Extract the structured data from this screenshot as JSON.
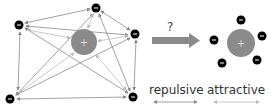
{
  "diagram": {
    "left_cluster": {
      "center_charge": {
        "sign": "+",
        "x": 84,
        "y": 42,
        "r": 13,
        "color": "#8a8a8a"
      },
      "negative_charges": [
        {
          "sign": "-",
          "x": 19,
          "y": 25
        },
        {
          "sign": "-",
          "x": 96,
          "y": 8
        },
        {
          "sign": "-",
          "x": 135,
          "y": 34
        },
        {
          "sign": "-",
          "x": 10,
          "y": 99
        },
        {
          "sign": "-",
          "x": 133,
          "y": 97
        }
      ]
    },
    "transition": {
      "label": "?",
      "arrow_color": "#8a8a8a"
    },
    "right_cluster": {
      "center_charge": {
        "sign": "+",
        "x": 241,
        "y": 43,
        "r": 14,
        "color": "#8a8a8a"
      },
      "negative_charges": [
        {
          "sign": "-",
          "x": 214,
          "y": 40
        },
        {
          "sign": "-",
          "x": 241,
          "y": 20
        },
        {
          "sign": "-",
          "x": 262,
          "y": 36
        },
        {
          "sign": "-",
          "x": 222,
          "y": 63
        },
        {
          "sign": "-",
          "x": 257,
          "y": 60
        }
      ]
    },
    "legend": {
      "repulsive": {
        "label": "repulsive",
        "color": "#888888"
      },
      "attractive": {
        "label": "attractive",
        "color": "#bbbbbb"
      }
    }
  }
}
